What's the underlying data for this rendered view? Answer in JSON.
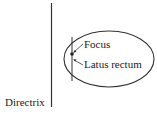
{
  "diagram": {
    "labels": {
      "focus": "Focus",
      "latus_rectum": "Latus rectum",
      "directrix": "Directrix"
    },
    "colors": {
      "stroke": "#333333",
      "text": "#222222",
      "background": "#ffffff"
    }
  }
}
